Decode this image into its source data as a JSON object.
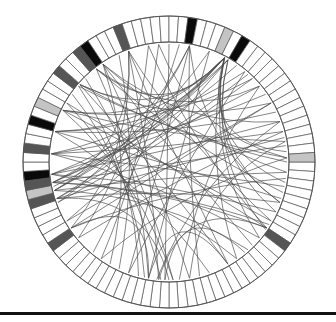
{
  "diagram": {
    "type": "chord-diagram",
    "center": [
      169,
      162
    ],
    "outer_radius": 146,
    "inner_radius": 120,
    "chord_radius": 118,
    "segment_count": 96,
    "colors": {
      "white": "#ffffff",
      "light": "#c4c4c4",
      "dark": "#555555",
      "black": "#0a0a0a",
      "stroke": "#555555",
      "chord": "#4a4a4a",
      "rule": "#111111"
    },
    "highlighted_segments": [
      {
        "angle": -110,
        "shade": "dark"
      },
      {
        "angle": -80,
        "shade": "black"
      },
      {
        "angle": -64,
        "shade": "light"
      },
      {
        "angle": -60,
        "shade": "black"
      },
      {
        "angle": -124,
        "shade": "black"
      },
      {
        "angle": -128,
        "shade": "dark"
      },
      {
        "angle": -139,
        "shade": "dark"
      },
      {
        "angle": -154,
        "shade": "light"
      },
      {
        "angle": -165,
        "shade": "black"
      },
      {
        "angle": -176,
        "shade": "dark"
      },
      {
        "angle": 174,
        "shade": "black"
      },
      {
        "angle": 170,
        "shade": "dark"
      },
      {
        "angle": 166,
        "shade": "light"
      },
      {
        "angle": 162,
        "shade": "dark"
      },
      {
        "angle": 146,
        "shade": "dark"
      },
      {
        "angle": -2,
        "shade": "light"
      },
      {
        "angle": 34,
        "shade": "dark"
      }
    ],
    "chords": [
      [
        -110,
        166
      ],
      [
        -110,
        146
      ],
      [
        -110,
        30
      ],
      [
        -110,
        60
      ],
      [
        -110,
        95
      ],
      [
        -80,
        170
      ],
      [
        -80,
        160
      ],
      [
        -80,
        110
      ],
      [
        -80,
        20
      ],
      [
        -80,
        75
      ],
      [
        -62,
        174
      ],
      [
        -62,
        170
      ],
      [
        -62,
        166
      ],
      [
        -62,
        162
      ],
      [
        -62,
        -165
      ],
      [
        -62,
        -154
      ],
      [
        -62,
        -139
      ],
      [
        -62,
        -128
      ],
      [
        -62,
        10
      ],
      [
        -62,
        25
      ],
      [
        -62,
        40
      ],
      [
        -62,
        -5
      ],
      [
        -62,
        55
      ],
      [
        -60,
        168
      ],
      [
        -60,
        -176
      ],
      [
        -60,
        150
      ],
      [
        -60,
        20
      ],
      [
        -60,
        35
      ],
      [
        -124,
        5
      ],
      [
        -124,
        45
      ],
      [
        -124,
        80
      ],
      [
        -124,
        -20
      ],
      [
        -124,
        120
      ],
      [
        -128,
        -40
      ],
      [
        -128,
        15
      ],
      [
        -128,
        100
      ],
      [
        -139,
        -30
      ],
      [
        -139,
        60
      ],
      [
        -139,
        0
      ],
      [
        -154,
        -45
      ],
      [
        -154,
        30
      ],
      [
        -154,
        -10
      ],
      [
        -154,
        88
      ],
      [
        -165,
        -50
      ],
      [
        -165,
        18
      ],
      [
        -165,
        70
      ],
      [
        -165,
        -25
      ],
      [
        -176,
        -35
      ],
      [
        -176,
        12
      ],
      [
        -176,
        40
      ],
      [
        -176,
        -15
      ],
      [
        174,
        -20
      ],
      [
        174,
        25
      ],
      [
        174,
        -40
      ],
      [
        174,
        55
      ],
      [
        170,
        -8
      ],
      [
        170,
        32
      ],
      [
        170,
        -55
      ],
      [
        166,
        5
      ],
      [
        166,
        48
      ],
      [
        166,
        -70
      ],
      [
        162,
        -12
      ],
      [
        162,
        20
      ],
      [
        162,
        90
      ],
      [
        162,
        -48
      ],
      [
        146,
        -30
      ],
      [
        146,
        8
      ],
      [
        146,
        100
      ],
      [
        -2,
        -95
      ],
      [
        -2,
        -140
      ],
      [
        -2,
        125
      ],
      [
        34,
        -100
      ],
      [
        34,
        -150
      ],
      [
        34,
        170
      ],
      [
        34,
        95
      ],
      [
        -95,
        125
      ],
      [
        -100,
        140
      ],
      [
        -90,
        92
      ],
      [
        -85,
        130
      ],
      [
        -70,
        100
      ],
      [
        -50,
        110
      ],
      [
        -45,
        160
      ],
      [
        -40,
        85
      ],
      [
        -30,
        150
      ],
      [
        -20,
        96
      ],
      [
        -15,
        140
      ],
      [
        -10,
        80
      ],
      [
        100,
        60
      ],
      [
        92,
        50
      ],
      [
        105,
        -140
      ],
      [
        115,
        -115
      ],
      [
        -145,
        102
      ],
      [
        -150,
        94
      ],
      [
        -135,
        88
      ]
    ]
  }
}
